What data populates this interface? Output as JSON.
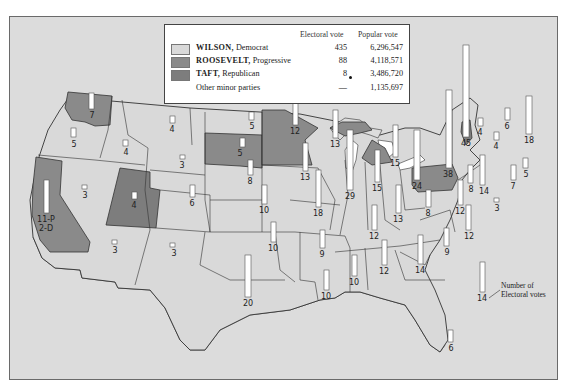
{
  "legend": {
    "header_electoral": "Electoral vote",
    "header_popular": "Popular vote",
    "rows": [
      {
        "candidate": "WILSON,",
        "party": "Democrat",
        "electoral": "435",
        "popular": "6,296,547",
        "color": "#d9d9d9"
      },
      {
        "candidate": "ROOSEVELT,",
        "party": "Progressive",
        "electoral": "88",
        "popular": "4,118,571",
        "color": "#8a8a8a"
      },
      {
        "candidate": "TAFT,",
        "party": "Republican",
        "electoral": "8",
        "popular": "3,486,720",
        "color": "#7d7d7d"
      },
      {
        "candidate": "",
        "party": "Other minor parties",
        "electoral": "—",
        "popular": "1,135,697",
        "color": ""
      }
    ]
  },
  "annotation": {
    "line1": "Number of",
    "line2": "Electoral votes",
    "example_value": "14"
  },
  "colors": {
    "wilson": "#d9d9d9",
    "roosevelt": "#8a8a8a",
    "taft": "#7d7d7d",
    "water": "#dcdcdc",
    "bar": "#ffffff"
  },
  "states": [
    {
      "name": "Washington",
      "ev": "7",
      "winner": "roosevelt"
    },
    {
      "name": "Oregon",
      "ev": "5",
      "winner": "wilson"
    },
    {
      "name": "California",
      "ev": "11-P 2-D",
      "winner": "roosevelt"
    },
    {
      "name": "Idaho",
      "ev": "4",
      "winner": "wilson"
    },
    {
      "name": "Nevada",
      "ev": "3",
      "winner": "wilson"
    },
    {
      "name": "Utah",
      "ev": "4",
      "winner": "taft"
    },
    {
      "name": "Arizona",
      "ev": "3",
      "winner": "wilson"
    },
    {
      "name": "Montana",
      "ev": "4",
      "winner": "wilson"
    },
    {
      "name": "Wyoming",
      "ev": "3",
      "winner": "wilson"
    },
    {
      "name": "Colorado",
      "ev": "6",
      "winner": "wilson"
    },
    {
      "name": "New Mexico",
      "ev": "3",
      "winner": "wilson"
    },
    {
      "name": "North Dakota",
      "ev": "5",
      "winner": "wilson"
    },
    {
      "name": "South Dakota",
      "ev": "5",
      "winner": "roosevelt"
    },
    {
      "name": "Nebraska",
      "ev": "8",
      "winner": "wilson"
    },
    {
      "name": "Kansas",
      "ev": "10",
      "winner": "wilson"
    },
    {
      "name": "Oklahoma",
      "ev": "10",
      "winner": "wilson"
    },
    {
      "name": "Texas",
      "ev": "20",
      "winner": "wilson"
    },
    {
      "name": "Minnesota",
      "ev": "12",
      "winner": "roosevelt"
    },
    {
      "name": "Iowa",
      "ev": "13",
      "winner": "wilson"
    },
    {
      "name": "Missouri",
      "ev": "18",
      "winner": "wilson"
    },
    {
      "name": "Arkansas",
      "ev": "9",
      "winner": "wilson"
    },
    {
      "name": "Louisiana",
      "ev": "10",
      "winner": "wilson"
    },
    {
      "name": "Wisconsin",
      "ev": "13",
      "winner": "wilson"
    },
    {
      "name": "Illinois",
      "ev": "29",
      "winner": "wilson"
    },
    {
      "name": "Michigan",
      "ev": "15",
      "winner": "roosevelt"
    },
    {
      "name": "Indiana",
      "ev": "15",
      "winner": "wilson"
    },
    {
      "name": "Ohio",
      "ev": "24",
      "winner": "wilson"
    },
    {
      "name": "Kentucky",
      "ev": "13",
      "winner": "wilson"
    },
    {
      "name": "Tennessee",
      "ev": "12",
      "winner": "wilson"
    },
    {
      "name": "Mississippi",
      "ev": "10",
      "winner": "wilson"
    },
    {
      "name": "Alabama",
      "ev": "12",
      "winner": "wilson"
    },
    {
      "name": "Georgia",
      "ev": "14",
      "winner": "wilson"
    },
    {
      "name": "Florida",
      "ev": "6",
      "winner": "wilson"
    },
    {
      "name": "South Carolina",
      "ev": "9",
      "winner": "wilson"
    },
    {
      "name": "North Carolina",
      "ev": "12",
      "winner": "wilson"
    },
    {
      "name": "Virginia",
      "ev": "12",
      "winner": "wilson"
    },
    {
      "name": "West Virginia",
      "ev": "8",
      "winner": "wilson"
    },
    {
      "name": "Pennsylvania",
      "ev": "38",
      "winner": "roosevelt"
    },
    {
      "name": "New York",
      "ev": "45",
      "winner": "wilson"
    },
    {
      "name": "Vermont",
      "ev": "4",
      "winner": "taft"
    },
    {
      "name": "New Hampshire",
      "ev": "4",
      "winner": "wilson"
    },
    {
      "name": "Maine",
      "ev": "6",
      "winner": "wilson"
    },
    {
      "name": "Massachusetts",
      "ev": "18",
      "winner": "wilson"
    },
    {
      "name": "Rhode Island",
      "ev": "5",
      "winner": "wilson"
    },
    {
      "name": "Connecticut",
      "ev": "7",
      "winner": "wilson"
    },
    {
      "name": "New Jersey",
      "ev": "14",
      "winner": "wilson"
    },
    {
      "name": "Delaware",
      "ev": "3",
      "winner": "wilson"
    },
    {
      "name": "Maryland",
      "ev": "8",
      "winner": "wilson"
    }
  ]
}
